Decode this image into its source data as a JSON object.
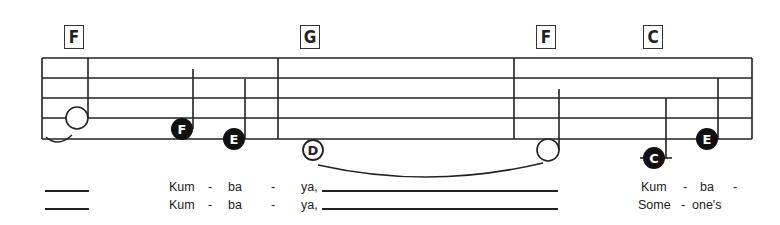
{
  "chords": [
    {
      "label": "F",
      "x": 64
    },
    {
      "label": "G",
      "x": 300
    },
    {
      "label": "F",
      "x": 536
    },
    {
      "label": "C",
      "x": 643
    }
  ],
  "notes": [
    {
      "name": "",
      "type": "half",
      "x": 76,
      "y": 118
    },
    {
      "name": "F",
      "type": "quarter",
      "x": 183,
      "y": 129
    },
    {
      "name": "E",
      "type": "quarter",
      "x": 235,
      "y": 139
    },
    {
      "name": "D",
      "type": "whole-tied",
      "x": 313,
      "y": 150
    },
    {
      "name": "",
      "type": "half-tied",
      "x": 548,
      "y": 150
    },
    {
      "name": "C",
      "type": "quarter-ledger",
      "x": 654,
      "y": 158
    },
    {
      "name": "E",
      "type": "quarter",
      "x": 707,
      "y": 139
    }
  ],
  "lyrics": {
    "verse1": {
      "pickup_blank": "",
      "syllables": [
        "Kum",
        "-",
        "ba",
        "-",
        "ya,"
      ],
      "pickup2": [
        "Kum",
        "-",
        "ba",
        "-"
      ]
    },
    "verse2": {
      "pickup_blank": "",
      "syllables": [
        "Kum",
        "-",
        "ba",
        "-",
        "ya,"
      ],
      "pickup2": [
        "Some",
        "-",
        "one's"
      ]
    }
  },
  "colors": {
    "ink": "#222222",
    "background": "#ffffff"
  }
}
